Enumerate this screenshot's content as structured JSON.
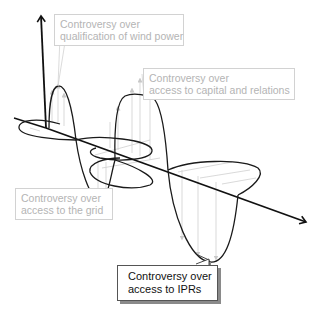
{
  "diagram": {
    "axes": {
      "vertical": {
        "direction": "up"
      },
      "horizontal": {
        "direction": "down-right"
      }
    },
    "labels": [
      {
        "id": "wind-power",
        "line1": "Controversy over",
        "line2": "qualification of wind power",
        "highlighted": false
      },
      {
        "id": "capital",
        "line1": "Controversy over",
        "line2": "access to capital and relations",
        "highlighted": false
      },
      {
        "id": "grid",
        "line1": "Controversy over",
        "line2": "access to the grid",
        "highlighted": false
      },
      {
        "id": "iprs",
        "line1": "Controversy over",
        "line2": "access to IPRs",
        "highlighted": true
      }
    ],
    "colors": {
      "axis": "#111111",
      "wave": "#1a1a1a",
      "projection": "#c8c8c8",
      "label_text_muted": "#b4b4b4",
      "label_border_muted": "#d2d2d2",
      "label_text_active": "#111111",
      "label_shadow": "#8a8a8a"
    }
  }
}
